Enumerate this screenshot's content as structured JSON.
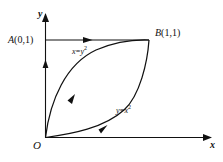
{
  "figure": {
    "background_color": "#ffffff",
    "stroke_color": "#111111",
    "axes": {
      "x_label": "x",
      "y_label": "y",
      "origin_label": "O"
    },
    "points": [
      {
        "name": "point-a",
        "label": "A(0,1)",
        "letter": "A",
        "coords": "(0,1)"
      },
      {
        "name": "point-b",
        "label": "B(1,1)",
        "letter": "B",
        "coords": "(1,1)"
      }
    ],
    "curves": [
      {
        "name": "curve-upper",
        "equation_text": "x=y",
        "exponent": "2",
        "equation_full": "x=y2",
        "direction": "from O to B"
      },
      {
        "name": "curve-lower",
        "equation_text": "y=x",
        "exponent": "2",
        "equation_full": "y=x2",
        "direction": "from O to B"
      }
    ],
    "segments": [
      {
        "name": "segment-a-to-b",
        "description": "horizontal arrow from A(0,1) to B(1,1)"
      },
      {
        "name": "segment-o-to-a",
        "description": "vertical arrow along y-axis from O to A(0,1)"
      }
    ]
  }
}
